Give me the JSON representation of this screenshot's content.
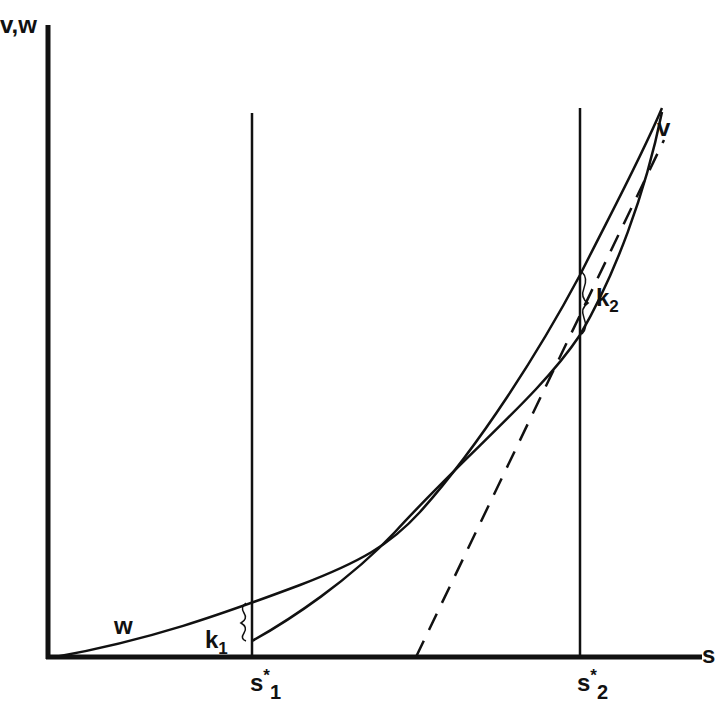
{
  "diagram": {
    "y_axis_label": "v,w",
    "x_axis_label": "s",
    "curves": [
      {
        "name": "w",
        "label": "w",
        "style": "solid"
      },
      {
        "name": "v",
        "label": "v",
        "style": "solid"
      },
      {
        "name": "tangent",
        "label": "",
        "style": "dashed"
      }
    ],
    "vertical_lines": [
      {
        "label_base": "s",
        "label_sup": "*",
        "label_sub": "1"
      },
      {
        "label_base": "s",
        "label_sup": "*",
        "label_sub": "2"
      }
    ],
    "gaps": [
      {
        "label_base": "k",
        "label_sub": "1"
      },
      {
        "label_base": "k",
        "label_sub": "2"
      }
    ],
    "colors": {
      "ink": "#111111",
      "background": "#ffffff"
    }
  }
}
